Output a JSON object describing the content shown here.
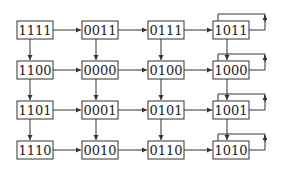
{
  "diagram": {
    "type": "state-grid",
    "nodes": [
      {
        "id": "n00",
        "label": "1111",
        "row": 0,
        "col": 0
      },
      {
        "id": "n01",
        "label": "0011",
        "row": 0,
        "col": 1
      },
      {
        "id": "n02",
        "label": "0111",
        "row": 0,
        "col": 2
      },
      {
        "id": "n03",
        "label": "1011",
        "row": 0,
        "col": 3
      },
      {
        "id": "n10",
        "label": "1100",
        "row": 1,
        "col": 0
      },
      {
        "id": "n11",
        "label": "0000",
        "row": 1,
        "col": 1
      },
      {
        "id": "n12",
        "label": "0100",
        "row": 1,
        "col": 2
      },
      {
        "id": "n13",
        "label": "1000",
        "row": 1,
        "col": 3
      },
      {
        "id": "n20",
        "label": "1101",
        "row": 2,
        "col": 0
      },
      {
        "id": "n21",
        "label": "0001",
        "row": 2,
        "col": 1
      },
      {
        "id": "n22",
        "label": "0101",
        "row": 2,
        "col": 2
      },
      {
        "id": "n23",
        "label": "1001",
        "row": 2,
        "col": 3
      },
      {
        "id": "n30",
        "label": "1110",
        "row": 3,
        "col": 0
      },
      {
        "id": "n31",
        "label": "0010",
        "row": 3,
        "col": 1
      },
      {
        "id": "n32",
        "label": "0110",
        "row": 3,
        "col": 2
      },
      {
        "id": "n33",
        "label": "1010",
        "row": 3,
        "col": 3
      }
    ],
    "edges": "each node points right to next column and down to next row; last column has self-loop",
    "colors": {
      "stroke": "#333333",
      "text": "#222222",
      "background": "#ffffff"
    }
  },
  "labels": {
    "r0": [
      "1111",
      "0011",
      "0111",
      "1011"
    ],
    "r1": [
      "1100",
      "0000",
      "0100",
      "1000"
    ],
    "r2": [
      "1101",
      "0001",
      "0101",
      "1001"
    ],
    "r3": [
      "1110",
      "0010",
      "0110",
      "1010"
    ]
  }
}
